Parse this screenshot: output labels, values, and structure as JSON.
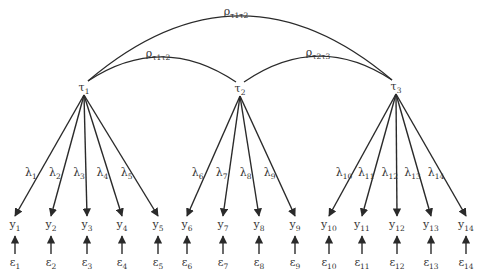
{
  "diagram": {
    "type": "measurement-model",
    "latent_factors": [
      {
        "id": "t1",
        "symbol": "τ",
        "sub": "1",
        "x": 84,
        "y": 87
      },
      {
        "id": "t2",
        "symbol": "τ",
        "sub": "2",
        "x": 240,
        "y": 88
      },
      {
        "id": "t3",
        "symbol": "τ",
        "sub": "3",
        "x": 396,
        "y": 86
      }
    ],
    "correlations": [
      {
        "from": "t1",
        "to": "t3",
        "label": "ρ",
        "sub": "τ1τ2",
        "label_x": 236,
        "label_y": 15
      },
      {
        "from": "t1",
        "to": "t2",
        "label": "ρ",
        "sub": "τ1τ2",
        "label_x": 158,
        "label_y": 57
      },
      {
        "from": "t2",
        "to": "t3",
        "label": "ρ",
        "sub": "τ2τ3",
        "label_x": 318,
        "label_y": 56
      }
    ],
    "indicators": [
      {
        "id": "y1",
        "factor": "t1",
        "x": 15,
        "loading": "λ",
        "loading_sub": "1",
        "error_sub": "1"
      },
      {
        "id": "y2",
        "factor": "t1",
        "x": 51,
        "loading": "λ",
        "loading_sub": "2",
        "error_sub": "2"
      },
      {
        "id": "y3",
        "factor": "t1",
        "x": 87,
        "loading": "λ",
        "loading_sub": "3",
        "error_sub": "3"
      },
      {
        "id": "y4",
        "factor": "t1",
        "x": 122,
        "loading": "λ",
        "loading_sub": "4",
        "error_sub": "4"
      },
      {
        "id": "y5",
        "factor": "t1",
        "x": 158,
        "loading": "λ",
        "loading_sub": "5",
        "error_sub": "5"
      },
      {
        "id": "y6",
        "factor": "t2",
        "x": 187,
        "loading": "λ",
        "loading_sub": "6",
        "error_sub": "6"
      },
      {
        "id": "y7",
        "factor": "t2",
        "x": 223,
        "loading": "λ",
        "loading_sub": "7",
        "error_sub": "7"
      },
      {
        "id": "y8",
        "factor": "t2",
        "x": 259,
        "loading": "λ",
        "loading_sub": "8",
        "error_sub": "8"
      },
      {
        "id": "y9",
        "factor": "t2",
        "x": 295,
        "loading": "λ",
        "loading_sub": "9",
        "error_sub": "9"
      },
      {
        "id": "y10",
        "factor": "t3",
        "x": 329,
        "loading": "λ",
        "loading_sub": "10",
        "error_sub": "10"
      },
      {
        "id": "y11",
        "factor": "t3",
        "x": 362,
        "loading": "λ",
        "loading_sub": "11",
        "error_sub": "11"
      },
      {
        "id": "y12",
        "factor": "t3",
        "x": 397,
        "loading": "λ",
        "loading_sub": "12",
        "error_sub": "12"
      },
      {
        "id": "y13",
        "factor": "t3",
        "x": 431,
        "loading": "λ",
        "loading_sub": "13",
        "error_sub": "13"
      },
      {
        "id": "y14",
        "factor": "t3",
        "x": 466,
        "loading": "λ",
        "loading_sub": "14",
        "error_sub": "14"
      }
    ],
    "indicator_symbol": "y",
    "error_symbol": "ε",
    "loading_label_y": 176,
    "indicator_label_y": 228,
    "error_label_y": 266,
    "colors": {
      "stroke": "#2a2a2a",
      "text": "#333333",
      "background": "#ffffff"
    }
  }
}
